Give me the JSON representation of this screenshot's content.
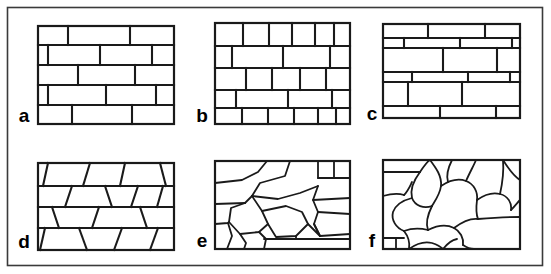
{
  "figure": {
    "background_color": "#ffffff",
    "line_color": "#1a1a1a",
    "frame_color": "#3a3a3a",
    "width": 551,
    "height": 274
  },
  "frame": {
    "x": 7,
    "y": 7,
    "width": 536,
    "height": 259
  },
  "panels": [
    {
      "id": "a",
      "label": "a",
      "name": "panel-a-coursed-running-bond",
      "description": "Regular coursed squared rubble, running bond with long stretcher blocks and staggered head joints; five courses of equal height.",
      "label_x": 24,
      "label_y": 122,
      "box": {
        "x": 38,
        "y": 26,
        "width": 136,
        "height": 98
      },
      "rows": 5,
      "row_lines_y": [
        45,
        65,
        85,
        105
      ],
      "vertical_joints": [
        [
          68,
          130
        ],
        [
          42,
          100,
          148
        ],
        [
          78,
          135
        ],
        [
          48,
          106,
          152
        ],
        [
          72,
          132
        ]
      ]
    },
    {
      "id": "b",
      "label": "b",
      "name": "panel-b-small-block-coursed",
      "description": "Coursed small squared blocks; alternating courses of many short blocks and fewer long blocks.",
      "label_x": 202,
      "label_y": 122,
      "box": {
        "x": 215,
        "y": 23,
        "width": 135,
        "height": 101
      },
      "rows": 5,
      "row_lines_y": [
        46,
        68,
        90,
        108
      ],
      "vertical_joints": [
        [
          243,
          269,
          292,
          315,
          334
        ],
        [
          232,
          283,
          330
        ],
        [
          246,
          272,
          300,
          326
        ],
        [
          236,
          288,
          332
        ],
        [
          242,
          268,
          294,
          318,
          336
        ]
      ]
    },
    {
      "id": "c",
      "label": "c",
      "name": "panel-c-alternating-course-height",
      "description": "Coursed masonry with alternating thin and thick courses; long stretchers broken by occasional short blocks.",
      "label_x": 372,
      "label_y": 120,
      "box": {
        "x": 383,
        "y": 24,
        "width": 137,
        "height": 94
      },
      "rows": 6,
      "row_lines_y": [
        38,
        48,
        72,
        82,
        106
      ],
      "vertical_joints": [
        [
          428,
          485
        ],
        [
          404,
          460,
          512
        ],
        [
          443,
          497
        ],
        [
          412,
          468,
          510
        ],
        [
          408,
          462
        ],
        [
          440,
          496
        ]
      ]
    },
    {
      "id": "d",
      "label": "d",
      "name": "panel-d-trapezoidal-coursed",
      "description": "Roughly coursed blocks with inclined (non-vertical) head joints producing trapezoidal units; four courses.",
      "label_x": 24,
      "label_y": 248,
      "box": {
        "x": 38,
        "y": 163,
        "width": 136,
        "height": 87
      },
      "rows": 4,
      "row_lines_y": [
        186,
        207,
        228
      ]
    },
    {
      "id": "e",
      "label": "e",
      "name": "panel-e-irregular-polygonal",
      "description": "Uncoursed irregular polygonal rubble; angular many-sided stones of mixed size with a few straight bounding courses.",
      "label_x": 202,
      "label_y": 247,
      "box": {
        "x": 215,
        "y": 161,
        "width": 135,
        "height": 88
      }
    },
    {
      "id": "f",
      "label": "f",
      "name": "panel-f-rounded-cobble",
      "description": "Uncoursed rounded cobble / boulder fabric; curved sub-rounded clasts packed together with a straight course near the base.",
      "label_x": 372,
      "label_y": 247,
      "box": {
        "x": 383,
        "y": 160,
        "width": 137,
        "height": 89
      }
    }
  ],
  "labels": [
    "a",
    "b",
    "c",
    "d",
    "e",
    "f"
  ]
}
